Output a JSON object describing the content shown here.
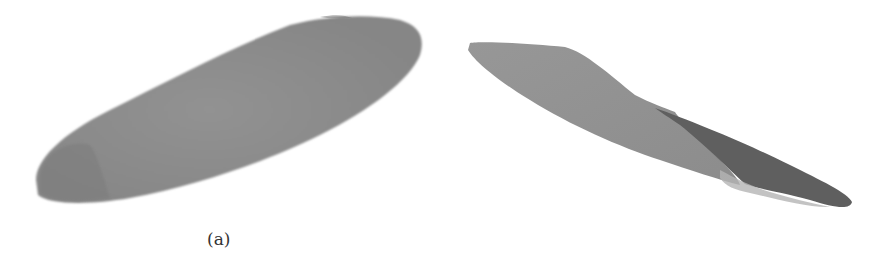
{
  "figure": {
    "panels": [
      {
        "id": "a",
        "caption": "(a)",
        "subject": "insole-top-view",
        "fill_color": "#8e8e8e",
        "shade_color": "#7a7a7a"
      },
      {
        "id": "b",
        "caption": "(b)",
        "subject": "insole-side-view",
        "fill_color": "#919191",
        "shade_color": "#5f5f5f",
        "highlight_color": "#b8b8b8"
      }
    ],
    "background": "#ffffff"
  }
}
